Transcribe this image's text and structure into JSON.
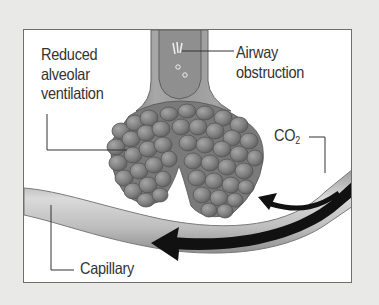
{
  "diagram": {
    "type": "physiology-illustration",
    "labels": {
      "reduced_ventilation": [
        "Reduced",
        "alveolar",
        "ventilation"
      ],
      "airway_obstruction": [
        "Airway",
        "obstruction"
      ],
      "co2": {
        "main": "CO",
        "subscript": "2"
      },
      "capillary": "Capillary"
    },
    "elements": [
      {
        "name": "airway",
        "description": "Bronchiole tube with obstruction (mucus) inside"
      },
      {
        "name": "alveoli",
        "description": "Grape-like clusters of alveolar sacs"
      },
      {
        "name": "capillary",
        "description": "Curved blood vessel passing beneath alveoli"
      },
      {
        "name": "blood-flow-arrow",
        "description": "Black arrow along capillary pointing left"
      },
      {
        "name": "co2-arrow",
        "description": "Curved black arrow from capillary toward alveoli"
      }
    ],
    "colors": {
      "background": "#e9e9e7",
      "panel": "#ffffff",
      "border": "#6f6f6f",
      "alveoli": "#7d7d7d",
      "capillary": "#b5b5b5",
      "arrow": "#111111",
      "text": "#333333"
    }
  }
}
